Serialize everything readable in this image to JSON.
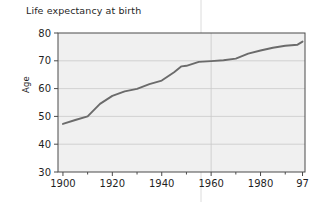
{
  "chart_data": {
    "type": "line",
    "title": "Life expectancy at birth",
    "xlabel": "",
    "ylabel": "Age",
    "xlim": [
      1898,
      1998
    ],
    "ylim": [
      30,
      80
    ],
    "grid": "both",
    "legend": "none",
    "x_ticks_major": [
      "1900",
      "1920",
      "1940",
      "1960",
      "1980",
      "97"
    ],
    "x_tick_values": [
      1900,
      1920,
      1940,
      1960,
      1980,
      1997
    ],
    "x_minor_tick_values": [
      1910,
      1930,
      1950,
      1970,
      1990
    ],
    "y_ticks": [
      "30",
      "40",
      "50",
      "60",
      "70",
      "80"
    ],
    "y_tick_values": [
      30,
      40,
      50,
      60,
      70,
      80
    ],
    "series": [
      {
        "name": "Life expectancy at birth",
        "color": "#6b6b6b",
        "x": [
          1900,
          1905,
          1910,
          1915,
          1920,
          1925,
          1930,
          1935,
          1940,
          1945,
          1948,
          1950,
          1955,
          1960,
          1965,
          1970,
          1975,
          1980,
          1985,
          1990,
          1995,
          1997
        ],
        "values": [
          47.3,
          48.7,
          50.0,
          54.5,
          57.4,
          59.0,
          59.9,
          61.6,
          62.9,
          65.9,
          68.0,
          68.2,
          69.6,
          69.9,
          70.2,
          70.8,
          72.6,
          73.7,
          74.7,
          75.4,
          75.8,
          76.9
        ]
      }
    ],
    "colors": {
      "line": "#6b6b6b",
      "plot_background": "#f0f0f0",
      "grid": "#c9c9c9",
      "axis": "#4a4a4a",
      "text": "#1f1f1f",
      "fold_line": "#d8d8d8"
    }
  }
}
